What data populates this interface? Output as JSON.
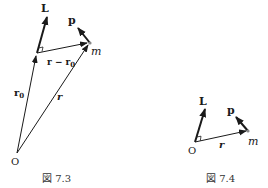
{
  "figures": [
    {
      "id": "fig-7-3",
      "caption": "図 7.3",
      "labels": {
        "L": "L",
        "p": "p",
        "m": "m",
        "r_minus_r0": "r − r",
        "r_minus_r0_sub": "0",
        "r0": "r",
        "r0_sub": "0",
        "r": "r",
        "O": "O"
      }
    },
    {
      "id": "fig-7-4",
      "caption": "図 7.4",
      "labels": {
        "L": "L",
        "p": "p",
        "m": "m",
        "r": "r",
        "O": "O"
      }
    }
  ]
}
